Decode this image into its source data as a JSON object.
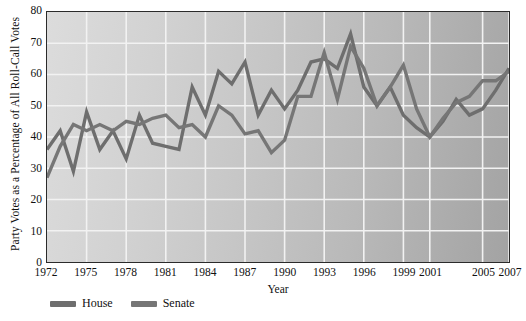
{
  "chart_data": {
    "type": "line",
    "title": "",
    "xlabel": "Year",
    "ylabel": "Party Votes as a Percentage of All Roll-Call Votes",
    "xlim": [
      1972,
      2007
    ],
    "ylim": [
      0,
      80
    ],
    "yticks": [
      0,
      10,
      20,
      30,
      40,
      50,
      60,
      70,
      80
    ],
    "xticks": [
      1972,
      1975,
      1978,
      1981,
      1984,
      1987,
      1990,
      1993,
      1996,
      1999,
      2001,
      2005,
      2007
    ],
    "xtick_labels": [
      "1972",
      "1975",
      "1978",
      "1981",
      "1984",
      "1987",
      "1990",
      "1993",
      "1996",
      "1999",
      "2001",
      "2005",
      "2007"
    ],
    "grid": true,
    "grid_color": "#f2f2f2",
    "legend_position": "below-left",
    "x": [
      1972,
      1973,
      1974,
      1975,
      1976,
      1977,
      1978,
      1979,
      1980,
      1981,
      1982,
      1983,
      1984,
      1985,
      1986,
      1987,
      1988,
      1989,
      1990,
      1991,
      1992,
      1993,
      1994,
      1995,
      1996,
      1997,
      1998,
      1999,
      2000,
      2001,
      2002,
      2003,
      2004,
      2005,
      2006,
      2007
    ],
    "series": [
      {
        "name": "House",
        "color": "#6e6e6e",
        "values": [
          36,
          42,
          29,
          48,
          36,
          42,
          33,
          47,
          38,
          37,
          36,
          56,
          47,
          61,
          57,
          64,
          47,
          55,
          49,
          55,
          64,
          65,
          62,
          73,
          56,
          50,
          56,
          47,
          43,
          40,
          45,
          52,
          47,
          49,
          55,
          62
        ]
      },
      {
        "name": "Senate",
        "color": "#767676",
        "values": [
          27,
          37,
          44,
          42,
          44,
          42,
          45,
          44,
          46,
          47,
          43,
          44,
          40,
          50,
          47,
          41,
          42,
          35,
          39,
          53,
          53,
          67,
          52,
          69,
          62,
          50,
          56,
          63,
          49,
          40,
          46,
          51,
          53,
          58,
          58,
          61
        ]
      }
    ]
  },
  "legend": {
    "items": [
      {
        "label": "House",
        "color": "#6e6e6e"
      },
      {
        "label": "Senate",
        "color": "#767676"
      }
    ]
  },
  "axis_titles": {
    "y": "Party Votes as a Percentage of All Roll-Call Votes",
    "x": "Year"
  }
}
